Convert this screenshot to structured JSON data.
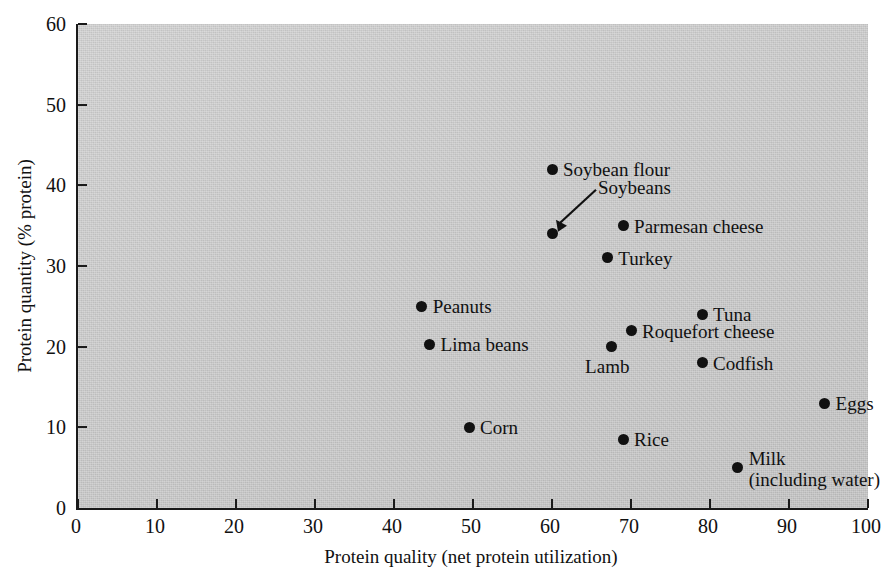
{
  "chart_data": {
    "type": "scatter",
    "title": "",
    "xlabel": "Protein quality (net protein utilization)",
    "ylabel": "Protein quantity (% protein)",
    "xlim": [
      0,
      100
    ],
    "ylim": [
      0,
      60
    ],
    "xticks": [
      0,
      10,
      20,
      30,
      40,
      50,
      60,
      70,
      80,
      90,
      100
    ],
    "yticks": [
      0,
      10,
      20,
      30,
      40,
      50,
      60
    ],
    "grid": false,
    "legend": "none",
    "background_color": "#c9c9c9",
    "point_color": "#111111",
    "points": [
      {
        "label": "Soybean flour",
        "x": 60,
        "y": 42,
        "label_pos": "right"
      },
      {
        "label": "Soybeans",
        "x": 60,
        "y": 34,
        "label_pos": "leader"
      },
      {
        "label": "Parmesan cheese",
        "x": 69,
        "y": 35,
        "label_pos": "right"
      },
      {
        "label": "Turkey",
        "x": 67,
        "y": 31,
        "label_pos": "right"
      },
      {
        "label": "Peanuts",
        "x": 43.5,
        "y": 25,
        "label_pos": "right"
      },
      {
        "label": "Tuna",
        "x": 79,
        "y": 24,
        "label_pos": "right"
      },
      {
        "label": "Roquefort cheese",
        "x": 70,
        "y": 22,
        "label_pos": "right"
      },
      {
        "label": "Lima beans",
        "x": 44.5,
        "y": 20.3,
        "label_pos": "right"
      },
      {
        "label": "Lamb",
        "x": 67.5,
        "y": 20,
        "label_pos": "below"
      },
      {
        "label": "Codfish",
        "x": 79,
        "y": 18,
        "label_pos": "right"
      },
      {
        "label": "Eggs",
        "x": 94.5,
        "y": 13,
        "label_pos": "right"
      },
      {
        "label": "Corn",
        "x": 49.5,
        "y": 10,
        "label_pos": "right"
      },
      {
        "label": "Rice",
        "x": 69,
        "y": 8.5,
        "label_pos": "right"
      },
      {
        "label": "Milk",
        "x": 83.5,
        "y": 5,
        "label_pos": "right",
        "sublabel": "(including water)"
      }
    ],
    "annotations": [
      {
        "name": "soybeans-leader",
        "text": "Soybeans",
        "points_to": [
          60,
          34
        ]
      }
    ]
  }
}
